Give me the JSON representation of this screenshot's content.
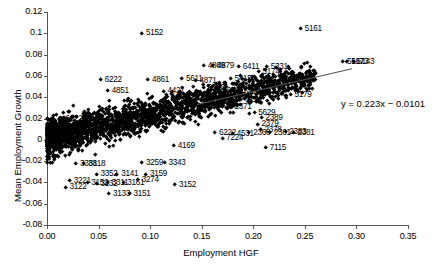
{
  "chart_data": {
    "type": "scatter",
    "title": "",
    "xlabel": "Employment HGF",
    "ylabel": "Mean Employment Growth",
    "xlim": [
      0.0,
      0.35
    ],
    "ylim": [
      -0.08,
      0.12
    ],
    "xticks": [
      "0.00",
      "0.05",
      "0.10",
      "0.15",
      "0.20",
      "0.25",
      "0.30",
      "0.35"
    ],
    "xtick_values": [
      0.0,
      0.05,
      0.1,
      0.15,
      0.2,
      0.25,
      0.3,
      0.35
    ],
    "yticks": [
      "0.12",
      "0.1",
      "0.08",
      "0.06",
      "0.04",
      "0.02",
      "0",
      "-0.02",
      "-0.04",
      "-0.06",
      "-0.08"
    ],
    "ytick_values": [
      0.12,
      0.1,
      0.08,
      0.06,
      0.04,
      0.02,
      0,
      -0.02,
      -0.04,
      -0.06,
      -0.08
    ],
    "grid": false,
    "legend": false,
    "marker": "diamond",
    "marker_color": "#000000",
    "trendline": {
      "equation": "y = 0.223x − 0.0101",
      "slope": 0.223,
      "intercept": -0.0101,
      "x_start": 0.145,
      "x_end": 0.295,
      "color": "#555555"
    },
    "labeled_points": [
      {
        "label": "5152",
        "x": 0.092,
        "y": 0.1
      },
      {
        "label": "5161",
        "x": 0.246,
        "y": 0.104
      },
      {
        "label": "6222",
        "x": 0.052,
        "y": 0.0565
      },
      {
        "label": "4851",
        "x": 0.059,
        "y": 0.046
      },
      {
        "label": "4861",
        "x": 0.098,
        "y": 0.0565
      },
      {
        "label": "4421",
        "x": 0.113,
        "y": 0.0455
      },
      {
        "label": "6112",
        "x": 0.122,
        "y": 0.0415
      },
      {
        "label": "4869",
        "x": 0.152,
        "y": 0.0695
      },
      {
        "label": "4879",
        "x": 0.161,
        "y": 0.0695
      },
      {
        "label": "5611",
        "x": 0.131,
        "y": 0.0575
      },
      {
        "label": "4871",
        "x": 0.144,
        "y": 0.0555
      },
      {
        "label": "6213",
        "x": 0.152,
        "y": 0.0485
      },
      {
        "label": "6411",
        "x": 0.186,
        "y": 0.0685
      },
      {
        "label": "5174",
        "x": 0.205,
        "y": 0.0635
      },
      {
        "label": "5331",
        "x": 0.213,
        "y": 0.0685
      },
      {
        "label": "5415",
        "x": 0.178,
        "y": 0.0575
      },
      {
        "label": "2619",
        "x": 0.199,
        "y": 0.0525
      },
      {
        "label": "3619",
        "x": 0.206,
        "y": 0.0515
      },
      {
        "label": "6859",
        "x": 0.158,
        "y": 0.0455
      },
      {
        "label": "5611",
        "x": 0.167,
        "y": 0.0435
      },
      {
        "label": "6413",
        "x": 0.187,
        "y": 0.0445
      },
      {
        "label": "1813",
        "x": 0.158,
        "y": 0.0365
      },
      {
        "label": "6114",
        "x": 0.188,
        "y": 0.0375
      },
      {
        "label": "5179",
        "x": 0.236,
        "y": 0.0425
      },
      {
        "label": "5173",
        "x": 0.291,
        "y": 0.0735
      },
      {
        "label": "5167",
        "x": 0.287,
        "y": 0.0735
      },
      {
        "label": "5143",
        "x": 0.297,
        "y": 0.0735
      },
      {
        "label": "2371",
        "x": 0.178,
        "y": 0.0305
      },
      {
        "label": "5629",
        "x": 0.201,
        "y": 0.0255
      },
      {
        "label": "2389",
        "x": 0.208,
        "y": 0.0205
      },
      {
        "label": "2379",
        "x": 0.204,
        "y": 0.0145
      },
      {
        "label": "2378",
        "x": 0.207,
        "y": 0.0095
      },
      {
        "label": "2368",
        "x": 0.196,
        "y": 0.0065
      },
      {
        "label": "2361",
        "x": 0.216,
        "y": 0.0065
      },
      {
        "label": "2383",
        "x": 0.231,
        "y": 0.0075
      },
      {
        "label": "2381",
        "x": 0.239,
        "y": 0.0065
      },
      {
        "label": "4531",
        "x": 0.18,
        "y": 0.0055
      },
      {
        "label": "7224",
        "x": 0.17,
        "y": 0.0015
      },
      {
        "label": "7115",
        "x": 0.212,
        "y": -0.0075
      },
      {
        "label": "6222",
        "x": 0.014,
        "y": 0.0195
      },
      {
        "label": "6222",
        "x": 0.163,
        "y": 0.0065
      },
      {
        "label": "4169",
        "x": 0.123,
        "y": -0.0055
      },
      {
        "label": "3259",
        "x": 0.092,
        "y": -0.0215
      },
      {
        "label": "3343",
        "x": 0.114,
        "y": -0.0215
      },
      {
        "label": "3818",
        "x": 0.036,
        "y": -0.0225
      },
      {
        "label": "3381",
        "x": 0.028,
        "y": -0.0225
      },
      {
        "label": "3352",
        "x": 0.048,
        "y": -0.0325
      },
      {
        "label": "3141",
        "x": 0.068,
        "y": -0.0325
      },
      {
        "label": "3159",
        "x": 0.096,
        "y": -0.0325
      },
      {
        "label": "3221",
        "x": 0.022,
        "y": -0.0385
      },
      {
        "label": "3152",
        "x": 0.039,
        "y": -0.0405
      },
      {
        "label": "3232",
        "x": 0.048,
        "y": -0.0415
      },
      {
        "label": "3311",
        "x": 0.059,
        "y": -0.0405
      },
      {
        "label": "3161",
        "x": 0.074,
        "y": -0.0405
      },
      {
        "label": "3274",
        "x": 0.088,
        "y": -0.0375
      },
      {
        "label": "3152",
        "x": 0.124,
        "y": -0.0425
      },
      {
        "label": "3122",
        "x": 0.018,
        "y": -0.0445
      },
      {
        "label": "3133",
        "x": 0.06,
        "y": -0.0505
      },
      {
        "label": "3151",
        "x": 0.08,
        "y": -0.0505
      }
    ]
  },
  "plot_area": {
    "left_px": 47,
    "top_px": 12,
    "width_px": 361,
    "height_px": 213
  }
}
